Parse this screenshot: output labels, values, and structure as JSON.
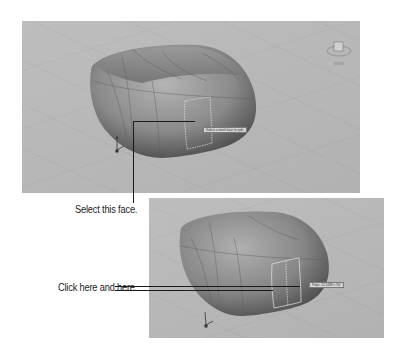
{
  "figure": {
    "panels": [
      {
        "id": "viewport-before",
        "tooltip": "Select a mesh face to split.",
        "has_viewcube": true,
        "has_ucs_icon": true
      },
      {
        "id": "viewport-after",
        "tooltip": "Polar: 12.5189 < 90°",
        "has_viewcube": false,
        "has_ucs_icon": true
      }
    ],
    "callouts": [
      {
        "label": "Select this face.",
        "target": "viewport-before"
      },
      {
        "label": "Click here and here.",
        "target": "viewport-after"
      }
    ]
  },
  "colors": {
    "viewport_bg": "#b9b9b9",
    "mesh_dark": "#4a4a4a",
    "mesh_light": "#a8a8a8",
    "callout_line": "#1a1a1a",
    "highlight_edge": "#e6e6e6"
  }
}
